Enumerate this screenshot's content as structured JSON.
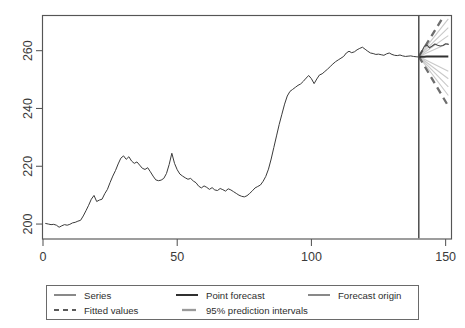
{
  "chart_data": {
    "type": "line",
    "title": "",
    "subtitle": "",
    "xlabel": "",
    "ylabel": "",
    "xlim": [
      0,
      152
    ],
    "ylim": [
      195,
      272
    ],
    "xticks": [
      0,
      50,
      100,
      150
    ],
    "xtick_labels": [
      "0",
      "50",
      "100",
      "150"
    ],
    "yticks": [
      200,
      220,
      240,
      260
    ],
    "ytick_labels": [
      "200",
      "220",
      "240",
      "260"
    ],
    "grid": false,
    "legend_position": "below",
    "forecast_origin": 140,
    "annotations": {
      "forecast_origin_note": "vertical line at x = 140 separating observed series from forecast region"
    },
    "series": [
      {
        "name": "Series",
        "style": "solid-thin",
        "color": "#3b3b3b",
        "x": [
          1,
          2,
          3,
          4,
          5,
          6,
          7,
          8,
          9,
          10,
          11,
          12,
          13,
          14,
          15,
          16,
          17,
          18,
          19,
          20,
          21,
          22,
          23,
          24,
          25,
          26,
          27,
          28,
          29,
          30,
          31,
          32,
          33,
          34,
          35,
          36,
          37,
          38,
          39,
          40,
          41,
          42,
          43,
          44,
          45,
          46,
          47,
          48,
          49,
          50,
          51,
          52,
          53,
          54,
          55,
          56,
          57,
          58,
          59,
          60,
          61,
          62,
          63,
          64,
          65,
          66,
          67,
          68,
          69,
          70,
          71,
          72,
          73,
          74,
          75,
          76,
          77,
          78,
          79,
          80,
          81,
          82,
          83,
          84,
          85,
          86,
          87,
          88,
          89,
          90,
          91,
          92,
          93,
          94,
          95,
          96,
          97,
          98,
          99,
          100,
          101,
          102,
          103,
          104,
          105,
          106,
          107,
          108,
          109,
          110,
          111,
          112,
          113,
          114,
          115,
          116,
          117,
          118,
          119,
          120,
          121,
          122,
          123,
          124,
          125,
          126,
          127,
          128,
          129,
          130,
          131,
          132,
          133,
          134,
          135,
          136,
          137,
          138,
          139,
          140
        ],
        "values": [
          200.2,
          200.0,
          199.8,
          199.9,
          199.6,
          198.9,
          199.4,
          199.8,
          199.6,
          199.9,
          200.4,
          200.6,
          201.0,
          201.3,
          202.8,
          204.6,
          206.5,
          208.6,
          209.9,
          207.8,
          208.3,
          208.6,
          210.5,
          212.0,
          214.4,
          216.6,
          218.5,
          220.8,
          222.8,
          223.6,
          222.4,
          223.3,
          221.8,
          221.0,
          221.5,
          220.4,
          219.3,
          218.9,
          219.5,
          218.1,
          216.6,
          215.3,
          215.0,
          215.2,
          215.8,
          217.5,
          220.6,
          224.5,
          221.0,
          218.8,
          217.3,
          216.6,
          216.0,
          215.5,
          215.8,
          214.9,
          214.3,
          213.1,
          212.5,
          213.2,
          212.7,
          212.0,
          212.6,
          211.8,
          211.6,
          212.3,
          211.9,
          211.4,
          212.2,
          211.8,
          211.2,
          210.6,
          210.0,
          209.6,
          209.4,
          209.8,
          210.6,
          211.5,
          212.5,
          213.0,
          213.5,
          214.8,
          216.5,
          219.0,
          222.5,
          226.5,
          230.5,
          234.5,
          238.0,
          241.5,
          244.3,
          245.9,
          246.6,
          247.3,
          248.0,
          248.5,
          249.4,
          250.5,
          251.4,
          250.3,
          248.6,
          250.2,
          251.6,
          252.0,
          252.8,
          253.6,
          254.5,
          255.4,
          256.2,
          256.8,
          257.4,
          258.0,
          259.2,
          259.8,
          259.3,
          259.6,
          260.3,
          260.8,
          261.2,
          260.5,
          259.8,
          259.2,
          259.0,
          258.7,
          258.8,
          258.6,
          258.4,
          258.9,
          259.2,
          258.7,
          258.4,
          258.3,
          258.5,
          258.2,
          258.0,
          258.1,
          258.2,
          258.0,
          257.9,
          257.8
        ]
      },
      {
        "name": "Point forecast",
        "style": "solid-thick",
        "color": "#313131",
        "x": [
          140,
          141,
          142,
          143,
          144,
          145,
          146,
          147,
          148,
          149,
          150,
          151
        ],
        "values": [
          257.8,
          257.9,
          257.9,
          258.0,
          258.0,
          258.0,
          258.0,
          258.0,
          258.0,
          258.0,
          258.0,
          258.0
        ]
      },
      {
        "name": "Fitted values",
        "style": "solid-thin-dark",
        "color": "#4a4a4a",
        "x": [
          140,
          141,
          142,
          143,
          144,
          145,
          146,
          147,
          148,
          149,
          150,
          151
        ],
        "values": [
          257.9,
          259.5,
          261.4,
          262.0,
          261.0,
          261.6,
          262.3,
          261.9,
          261.6,
          261.8,
          262.4,
          262.2
        ]
      },
      {
        "name": "95% prediction intervals",
        "style": "dashed-thick",
        "color": "#6e6e6e",
        "x": [
          140,
          151
        ],
        "upper": [
          258.0,
          274.5
        ],
        "lower": [
          258.0,
          240.8
        ]
      }
    ],
    "inner_intervals": {
      "name": "inner prediction bands",
      "style": "solid-light",
      "color": "#c9c9c9",
      "x": [
        140,
        151
      ],
      "levels": [
        {
          "upper": [
            258.0,
            271.0
          ],
          "lower": [
            258.0,
            244.5
          ]
        },
        {
          "upper": [
            258.0,
            268.0
          ],
          "lower": [
            258.0,
            247.5
          ]
        },
        {
          "upper": [
            258.0,
            265.2
          ],
          "lower": [
            258.0,
            250.3
          ]
        },
        {
          "upper": [
            258.0,
            262.6
          ],
          "lower": [
            258.0,
            252.9
          ]
        }
      ]
    }
  },
  "legend": {
    "entries": [
      {
        "label": "Series",
        "key": "solid-thin"
      },
      {
        "label": "Fitted values",
        "key": "dashed"
      },
      {
        "label": "Point forecast",
        "key": "solid-thick"
      },
      {
        "label": "95% prediction intervals",
        "key": "grey-thick"
      },
      {
        "label": "Forecast origin",
        "key": "solid-thin"
      }
    ]
  }
}
